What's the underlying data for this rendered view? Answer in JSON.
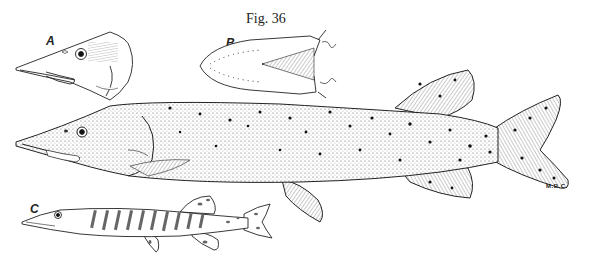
{
  "figure": {
    "title": "Fig. 36",
    "panels": [
      {
        "label": "A",
        "description": "head of pike, lateral view"
      },
      {
        "label": "B",
        "description": "head, ventral view showing lower jaw"
      },
      {
        "label": "C",
        "description": "juvenile pike with vertical bars"
      }
    ],
    "main_subject": "adult pike, lateral view, spotted body",
    "artist_signature": "M.B.C.",
    "colors": {
      "ink": "#222222",
      "background": "#ffffff"
    }
  }
}
